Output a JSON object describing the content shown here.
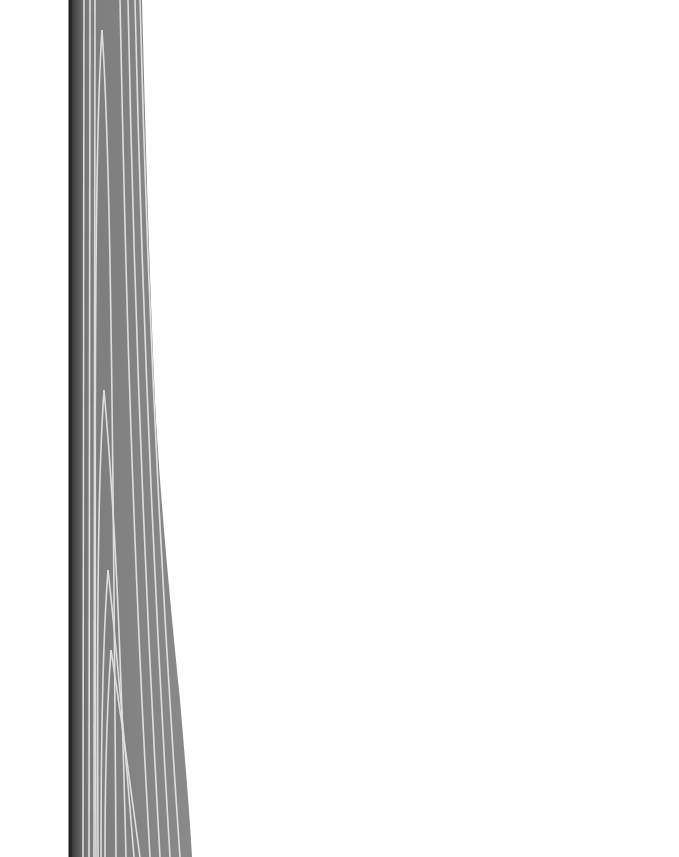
{
  "image": {
    "subject": "wood grain strip",
    "background_color": "#ffffff",
    "strip": {
      "base_color": "#7a7a7a",
      "dark_edge_color": "#3a3a3a",
      "grain_color": "#e6e6e6",
      "left_edge_x": 70,
      "top_width": 72,
      "bottom_width": 122
    }
  }
}
